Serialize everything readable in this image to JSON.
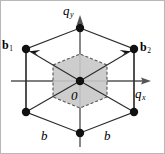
{
  "figure": {
    "name": "hexagonal-reciprocal-lattice",
    "width": 165,
    "height": 154,
    "background": "#ffffff",
    "border_color": "#b8b8b8"
  },
  "axes": {
    "x_label": "q",
    "x_subscript": "x",
    "y_label": "q",
    "y_subscript": "y",
    "origin_label": "0",
    "axis_color": "#555555",
    "arrow_color": "#555555"
  },
  "vectors": [
    {
      "id": "b1",
      "label": "b",
      "subscript": "1",
      "tip_x": 25,
      "tip_y": 48,
      "color": "#2b2b2b"
    },
    {
      "id": "b2",
      "label": "b",
      "subscript": "2",
      "tip_x": 133,
      "tip_y": 48,
      "color": "#2b2b2b"
    }
  ],
  "edge_labels": [
    {
      "id": "b-left",
      "label": "b"
    },
    {
      "id": "b-right",
      "label": "b"
    }
  ],
  "lattice_points": [
    {
      "cx": 79,
      "cy": 27,
      "r": 4.2
    },
    {
      "cx": 25,
      "cy": 48,
      "r": 4.2
    },
    {
      "cx": 133,
      "cy": 48,
      "r": 4.2
    },
    {
      "cx": 79,
      "cy": 80,
      "r": 4.2
    },
    {
      "cx": 25,
      "cy": 111,
      "r": 4.2
    },
    {
      "cx": 133,
      "cy": 111,
      "r": 4.2
    },
    {
      "cx": 79,
      "cy": 132,
      "r": 4.2
    }
  ],
  "brillouin_zone": {
    "shape": "hexagon",
    "fill": "#c8c8c8",
    "stroke": "#555555",
    "stroke_dash": "3,2",
    "points": "52,64 79,53 106,64 106,96 79,107 52,96"
  },
  "lattice_cell": {
    "stroke": "#2b2b2b",
    "fill": "none",
    "points": "79,27 133,48 133,111 79,132 25,111 25,48"
  },
  "dot_color": "#111111"
}
